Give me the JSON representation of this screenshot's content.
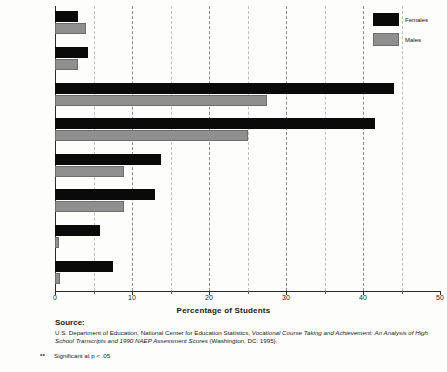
{
  "chart_data": {
    "type": "bar",
    "orientation": "horizontal",
    "title": "",
    "xlabel": "Percentage of Students",
    "ylabel": "",
    "xlim": [
      0,
      50
    ],
    "xticks": [
      0,
      10,
      20,
      30,
      40,
      50
    ],
    "xtick_labels": [
      "0",
      "10",
      "20",
      "30",
      "40",
      "50"
    ],
    "minor_ticks": [
      5,
      15,
      25,
      35,
      45
    ],
    "grid": "vertical-dashed",
    "legend_position": "top-right",
    "categories": [
      "Art/Music Appreciation or History 1994",
      "Art/Music Appreciation or History 1990",
      "Music 1994",
      "Music 1990",
      "Drama 1994",
      "Drama 1990",
      "Dance 1994",
      "Dance 1990"
    ],
    "series": [
      {
        "name": "Females",
        "color": "#0a0a0a",
        "values": [
          3.0,
          4.3,
          44.0,
          41.5,
          13.8,
          13.0,
          5.8,
          7.5
        ]
      },
      {
        "name": "Males",
        "color": "#8f8f8f",
        "values": [
          4.0,
          3.0,
          27.5,
          25.0,
          9.0,
          9.0,
          0.5,
          0.7
        ]
      }
    ],
    "significance_markers": [
      "",
      "",
      "***",
      "**",
      "***",
      "***",
      "***",
      "***"
    ]
  },
  "rows": [
    {
      "stars": "",
      "line1": "Art/Music Appreciation",
      "line2": "or History 1994",
      "female": 3.0,
      "male": 4.0
    },
    {
      "stars": "",
      "line1": "Art/Music Appreciation",
      "line2": "or History 1990",
      "female": 4.3,
      "male": 3.0
    },
    {
      "stars": "***",
      "line1": "Music 1994",
      "line2": "",
      "female": 44.0,
      "male": 27.5
    },
    {
      "stars": "**",
      "line1": "Music 1990",
      "line2": "",
      "female": 41.5,
      "male": 25.0
    },
    {
      "stars": "***",
      "line1": "Drama 1994",
      "line2": "",
      "female": 13.8,
      "male": 9.0
    },
    {
      "stars": "***",
      "line1": "Drama 1990",
      "line2": "",
      "female": 13.0,
      "male": 9.0
    },
    {
      "stars": "***",
      "line1": "Dance 1994",
      "line2": "",
      "female": 5.8,
      "male": 0.5
    },
    {
      "stars": "***",
      "line1": "Dance 1990",
      "line2": "",
      "female": 7.5,
      "male": 0.7
    }
  ],
  "legend": {
    "females_label": "Females",
    "males_label": "Males"
  },
  "axis": {
    "x_title": "Percentage of Students",
    "tick_0": "0",
    "tick_10": "10",
    "tick_20": "20",
    "tick_30": "30",
    "tick_40": "40",
    "tick_50": "50"
  },
  "footer": {
    "source_heading": "Source:",
    "source_text_1": "U.S. Department of Education, National Center for Education Statistics, ",
    "source_text_italic_1": "Vocational Course Taking and Achievement:",
    "source_text_italic_2": "An Analysis of High School Transcripts and 1990 NAEP Assessment Scores",
    "source_text_2": " (Washington, DC: 1995).",
    "footnote_stars": "**",
    "footnote_text": "Significant at p < .05"
  }
}
